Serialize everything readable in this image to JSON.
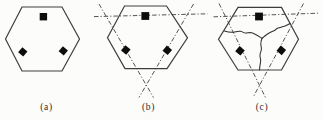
{
  "figure": {
    "colors": {
      "background": "#fcfcfb",
      "outline": "#3e3e3e",
      "dashdot": "#4b4b4b",
      "site_fill": "#0d0d0d",
      "caption_text": "#2b2b2b"
    },
    "width": 322,
    "height": 120
  },
  "panels": [
    {
      "id": "a",
      "label": "(a)",
      "label_pos": {
        "x": 46.5,
        "y": 110
      },
      "hexagon": [
        [
          22,
          7
        ],
        [
          62,
          7
        ],
        [
          79.5,
          39
        ],
        [
          62,
          71
        ],
        [
          22,
          71
        ],
        [
          5.5,
          39
        ]
      ],
      "squares": [
        {
          "name": "top",
          "cx": 43.4,
          "cy": 16.7,
          "size": 7.4,
          "rotate": 0
        },
        {
          "name": "left",
          "cx": 22.8,
          "cy": 51.8,
          "size": 6.6,
          "rotate": 40
        },
        {
          "name": "right",
          "cx": 63.3,
          "cy": 50.8,
          "size": 6.6,
          "rotate": 40
        }
      ],
      "dashdot_lines": [],
      "partition_paths": []
    },
    {
      "id": "b",
      "label": "(b)",
      "label_pos": {
        "x": 148.5,
        "y": 110
      },
      "hexagon": [
        [
          124.5,
          6
        ],
        [
          166.5,
          6
        ],
        [
          187.5,
          37.8
        ],
        [
          167,
          68.6
        ],
        [
          125,
          68.6
        ],
        [
          107.5,
          37.8
        ]
      ],
      "squares": [
        {
          "name": "top",
          "cx": 145.3,
          "cy": 16.0,
          "size": 7.8,
          "rotate": 0
        },
        {
          "name": "left",
          "cx": 125.8,
          "cy": 50.0,
          "size": 6.8,
          "rotate": 40
        },
        {
          "name": "right",
          "cx": 167.3,
          "cy": 50.3,
          "size": 6.8,
          "rotate": 40
        }
      ],
      "dashdot_lines": [
        [
          [
            94,
            16.6
          ],
          [
            207.5,
            13.8
          ]
        ],
        [
          [
            99,
            4
          ],
          [
            153.5,
            97.5
          ]
        ],
        [
          [
            193.5,
            4
          ],
          [
            139,
            97.5
          ]
        ]
      ],
      "partition_paths": []
    },
    {
      "id": "c",
      "label": "(c)",
      "label_pos": {
        "x": 262,
        "y": 109.5
      },
      "hexagon": [
        [
          238,
          7.4
        ],
        [
          281.5,
          7.4
        ],
        [
          298.5,
          39.2
        ],
        [
          281.5,
          70
        ],
        [
          238,
          70
        ],
        [
          218.5,
          39.2
        ]
      ],
      "squares": [
        {
          "name": "top",
          "cx": 259.0,
          "cy": 16.5,
          "size": 7.8,
          "rotate": 0
        },
        {
          "name": "left",
          "cx": 240.0,
          "cy": 50.8,
          "size": 6.8,
          "rotate": 40
        },
        {
          "name": "right",
          "cx": 281.3,
          "cy": 50.4,
          "size": 6.8,
          "rotate": 40
        }
      ],
      "dashdot_lines": [
        [
          [
            213.5,
            16.8
          ],
          [
            318,
            13.2
          ]
        ],
        [
          [
            219,
            3.5
          ],
          [
            265.5,
            97.5
          ]
        ],
        [
          [
            303.5,
            3.5
          ],
          [
            253,
            97.5
          ]
        ]
      ],
      "partition_paths": [
        {
          "name": "left-branch",
          "d": "M224.5,31 C229,32.5 231,32.6 233.5,32.2 C236.5,31.7 238,30.8 240.5,31.3 C243.5,31.9 243,33 245.5,33 C248,33 249.5,32.2 251.5,32.8 C255,33.8 258.5,36.2 262,38.3"
        },
        {
          "name": "right-branch",
          "d": "M262,38.3 C264,36.5 265.5,35.3 267.5,34 C270,32.3 272,31.5 274.5,30.5 C276,29.9 276,28.6 278,28 C280.5,27.2 282.5,26.8 285,25.9 C287,25.1 288.5,24.4 290,23.5"
        },
        {
          "name": "down-branch",
          "d": "M262,38.3 C261,41 260.7,42.5 260.8,44.5 C261,47 261.8,47.5 261.3,50 C260.8,52.5 259.8,53 260,56 C260.2,58.5 260.9,59 260.6,61.5 C260.3,64 259.7,66.5 259.5,70"
        }
      ]
    }
  ]
}
